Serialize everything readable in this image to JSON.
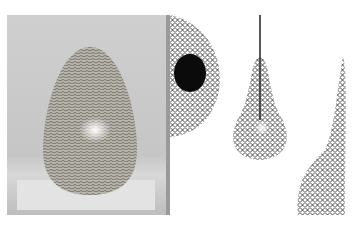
{
  "image": {
    "description": "Collage of woven/net lamp shade photographs",
    "panels": [
      {
        "subject": "egg-shaped woven fiber lamp on pedestal",
        "tone": "grayscale"
      },
      {
        "subject": "close-up of black net shade with dark opening"
      },
      {
        "subject": "pear-shaped black net pendant lamp with cord"
      },
      {
        "subject": "tall tapered net lamp shade partially cropped"
      }
    ]
  }
}
